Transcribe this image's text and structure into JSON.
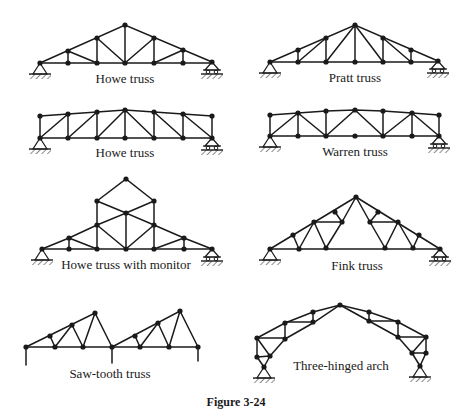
{
  "figure": {
    "caption": "Figure 3-24",
    "trusses": [
      {
        "id": "howe-1",
        "label": "Howe truss"
      },
      {
        "id": "pratt",
        "label": "Pratt truss"
      },
      {
        "id": "howe-2",
        "label": "Howe truss"
      },
      {
        "id": "warren",
        "label": "Warren truss"
      },
      {
        "id": "howe-monitor",
        "label": "Howe truss with monitor"
      },
      {
        "id": "fink",
        "label": "Fink truss"
      },
      {
        "id": "saw-tooth",
        "label": "Saw-tooth truss"
      },
      {
        "id": "three-hinged-arch",
        "label": "Three-hinged arch"
      }
    ]
  },
  "colors": {
    "line": "#1a1a1a",
    "background": "#ffffff"
  }
}
